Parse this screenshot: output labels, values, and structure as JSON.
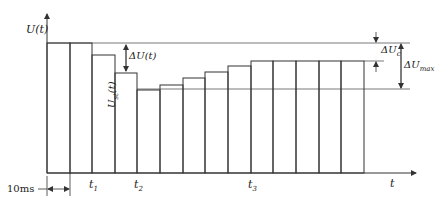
{
  "diagram": {
    "type": "step-voltage-waveform",
    "axes": {
      "y_label": "U(t)",
      "x_label": "t"
    },
    "bars": {
      "count": 14,
      "x_edges": [
        47,
        70,
        92,
        115,
        137,
        160,
        183,
        205,
        228,
        251,
        273,
        296,
        319,
        341,
        364
      ],
      "tops": [
        43,
        43,
        55,
        73,
        90,
        85,
        78,
        72,
        66,
        61,
        61,
        61,
        61,
        61
      ],
      "baseline_y": 173
    },
    "reference_lines": {
      "max_level_y": 43,
      "settled_level_y": 61,
      "min_level_y": 89
    },
    "annotations": {
      "delta_u_t": "ΔU(t)",
      "u_st_main": "U",
      "u_st_sub": "st",
      "u_st_suffix": "(t)",
      "delta_uc_main": "ΔU",
      "delta_uc_sub": "c",
      "delta_umax_main": "ΔU",
      "delta_umax_sub": "max"
    },
    "time_marks": {
      "t1": {
        "main": "t",
        "sub": "1"
      },
      "t2": {
        "main": "t",
        "sub": "2"
      },
      "t3": {
        "main": "t",
        "sub": "3"
      }
    },
    "interval_label": "10ms",
    "colors": {
      "line": "#333333",
      "light_line": "#555555",
      "background": "#ffffff"
    }
  }
}
